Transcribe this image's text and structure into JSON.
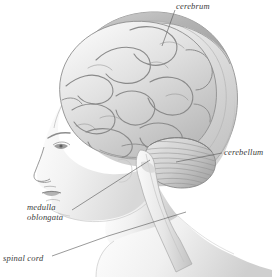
{
  "figure": {
    "background_color": "#ffffff",
    "ink_color": "#3a3a3a",
    "width": 272,
    "height": 277,
    "style": "grayscale medical illustration, left lateral profile"
  },
  "labels": {
    "cerebrum": "cerebrum",
    "cerebellum": "cerebellum",
    "medulla_line1": "medulla",
    "medulla_line2": "oblongata",
    "spinal_cord": "spinal cord"
  },
  "structures": [
    {
      "name": "cerebrum",
      "description": "large convoluted cerebral hemisphere filling the upper cranium"
    },
    {
      "name": "cerebellum",
      "description": "striated folia mass below the occipital cerebrum"
    },
    {
      "name": "medulla oblongata",
      "description": "brainstem segment below the pons"
    },
    {
      "name": "spinal cord",
      "description": "cord continuing down through the neck"
    },
    {
      "name": "skull",
      "description": "cranial vault outline enclosing the brain"
    },
    {
      "name": "face",
      "description": "profile of forehead, brow, eye, nose, lips, chin"
    },
    {
      "name": "neck",
      "description": "neck and shoulder contour"
    }
  ]
}
